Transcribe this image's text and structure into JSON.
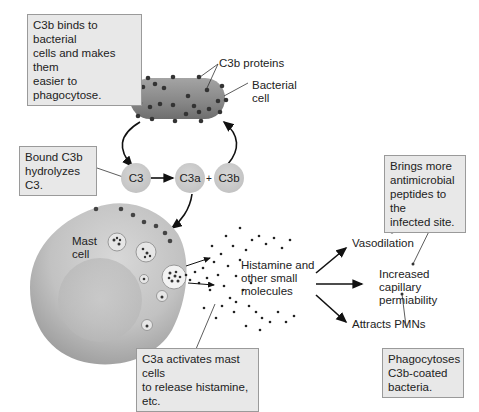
{
  "callouts": {
    "c3b_binds": [
      "C3b binds to bacterial",
      "cells and makes them",
      "easier to phagocytose."
    ],
    "bound_c3b": [
      "Bound C3b",
      "hydrolyzes C3."
    ],
    "c3a_activates": [
      "C3a activates mast cells",
      "to release histamine, etc."
    ],
    "brings_more": [
      "Brings more",
      "antimicrobial",
      "peptides to the",
      "infected site."
    ],
    "phagocytoses": [
      "Phagocytoses",
      "C3b-coated",
      "bacteria."
    ]
  },
  "labels": {
    "c3b_proteins": "C3b proteins",
    "bacterial_cell": [
      "Bacterial",
      "cell"
    ],
    "mast_cell": [
      "Mast",
      "cell"
    ],
    "histamine": [
      "Histamine and",
      "other small",
      "molecules"
    ],
    "vasodilation": "Vasodilation",
    "capillary": [
      "Increased",
      "capillary",
      "permiability"
    ],
    "attracts": "Attracts PMNs",
    "plus": "+"
  },
  "nodes": {
    "c3": "C3",
    "c3a": "C3a",
    "c3b": "C3b"
  },
  "colors": {
    "callout_bg": "#e8e8e8",
    "callout_border": "#9a9a9a",
    "node_fill": "#c8c8c8",
    "bacterium": "#8a8a8a",
    "mast_cell": "#c4c4c4",
    "dot": "#333333"
  }
}
